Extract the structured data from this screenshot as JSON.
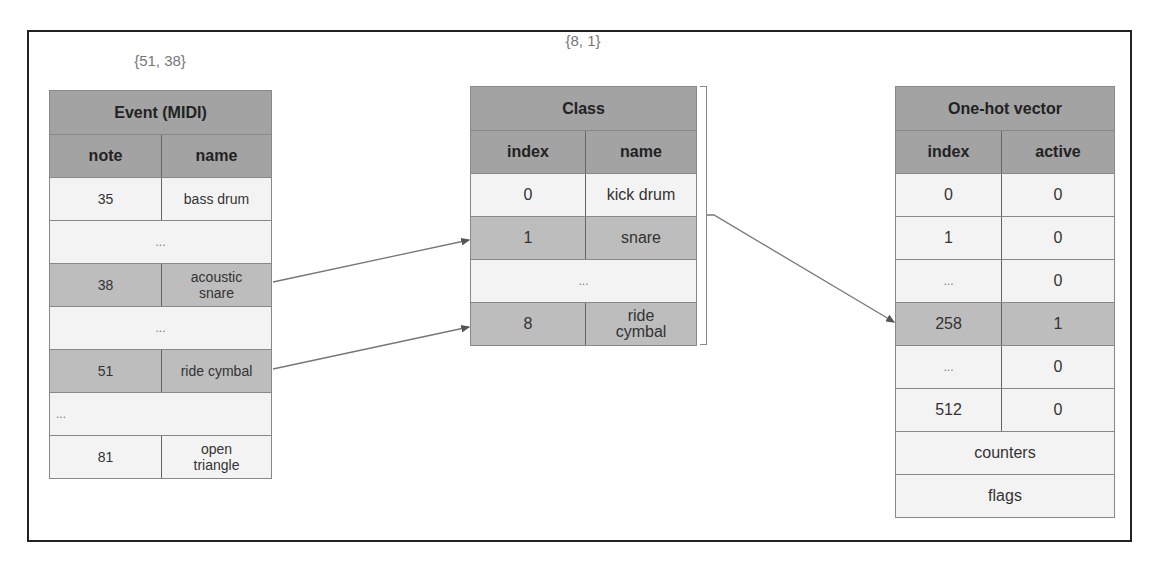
{
  "diagram": {
    "tables": {
      "event": {
        "caption": "{51, 38}",
        "title": "Event (MIDI)",
        "headers": [
          "note",
          "name"
        ],
        "rows": [
          {
            "col1": "35",
            "col2": "bass drum",
            "style": "light"
          },
          {
            "span": "...",
            "style": "light"
          },
          {
            "col1": "38",
            "col2": "acoustic snare",
            "style": "mid"
          },
          {
            "span": "...",
            "style": "light"
          },
          {
            "col1": "51",
            "col2": "ride cymbal",
            "style": "mid"
          },
          {
            "span": "...",
            "style": "light",
            "align": "left"
          },
          {
            "col1": "81",
            "col2": "open triangle",
            "style": "light"
          }
        ]
      },
      "class": {
        "caption": "{8, 1}",
        "title": "Class",
        "headers": [
          "index",
          "name"
        ],
        "rows": [
          {
            "col1": "0",
            "col2": "kick drum",
            "style": "light"
          },
          {
            "col1": "1",
            "col2": "snare",
            "style": "mid"
          },
          {
            "span": "...",
            "style": "light"
          },
          {
            "col1": "8",
            "col2": "ride cymbal",
            "style": "mid"
          }
        ]
      },
      "onehot": {
        "title": "One-hot vector",
        "headers": [
          "index",
          "active"
        ],
        "rows": [
          {
            "col1": "0",
            "col2": "0",
            "style": "light"
          },
          {
            "col1": "1",
            "col2": "0",
            "style": "light"
          },
          {
            "col1": "...",
            "col2": "0",
            "style": "light"
          },
          {
            "col1": "258",
            "col2": "1",
            "style": "mid"
          },
          {
            "col1": "...",
            "col2": "0",
            "style": "light"
          },
          {
            "col1": "512",
            "col2": "0",
            "style": "light"
          },
          {
            "span": "counters",
            "style": "light"
          },
          {
            "span": "flags",
            "style": "light"
          }
        ]
      }
    },
    "arrows": [
      {
        "from": "event.acoustic snare",
        "to": "class.snare"
      },
      {
        "from": "event.ride cymbal",
        "to": "class.ride cymbal"
      },
      {
        "from": "class (all)",
        "to": "onehot.258"
      }
    ],
    "colors": {
      "header": "#a3a3a3",
      "highlight": "#bdbdbd",
      "cell": "#f3f3f3",
      "border": "#888888",
      "frame": "#222222"
    }
  }
}
